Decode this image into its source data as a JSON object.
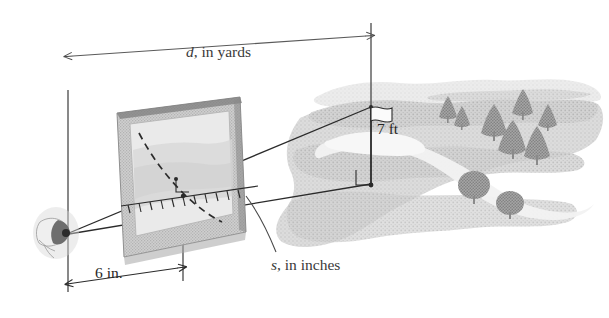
{
  "figure": {
    "name": "rangefinder-sighting-diagram",
    "background_color": "#ffffff"
  },
  "labels": {
    "distance": {
      "symbol": "d",
      "separator": ", in ",
      "unit": "yards",
      "full": "d, in yards"
    },
    "height": {
      "full": "7 ft",
      "value": 7,
      "unit": "ft"
    },
    "eye_to_scale": {
      "full": "6 in.",
      "value": 6,
      "unit": "in."
    },
    "scale_reading": {
      "symbol": "s",
      "separator": ", in ",
      "unit": "inches",
      "full": "s, in inches"
    }
  },
  "colors": {
    "line": "#2b2b2b",
    "dimension_line": "#5a5a5a",
    "frame_border": "#9a9a9a",
    "frame_face": "#d9d9d9",
    "frame_inner": "#e8e8e8",
    "landscape_light": "#dcdcdc",
    "landscape_mid": "#c9c9c9",
    "landscape_dark": "#b4b4b4",
    "tree": "#8d8d8d",
    "text": "#3a3a3a"
  },
  "elements": {
    "eye": "eye-icon",
    "flag": "flag-icon",
    "right_angle_marker_flagpole": "right-angle-icon",
    "right_angle_marker_scale": "right-angle-icon",
    "ruler": "ruler-scale-icon",
    "sight_line_top": "sight-line-to-flag-top",
    "sight_line_bottom": "sight-line-to-flag-base",
    "dashed_arc": "dashed-curve",
    "leader_line": "leader-line-s"
  },
  "landscape": {
    "conifer_tree_count": 7,
    "bush_count": 2,
    "river": "meandering-river"
  }
}
